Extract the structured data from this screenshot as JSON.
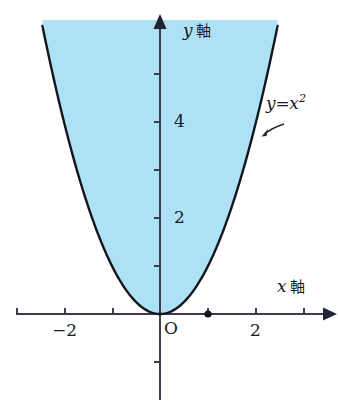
{
  "figure": {
    "kind": "cartesian-plot",
    "background_color": "#ffffff",
    "curve_color": "#15161c",
    "axis_color": "#3a3f4d",
    "fill_color": "#ade1f5",
    "labels": {
      "y_axis_var": "y",
      "y_axis_word": "軸",
      "x_axis_var": "x",
      "x_axis_word": "軸",
      "origin": "O",
      "curve_lhs": "y",
      "curve_eq": "=",
      "curve_rhs_base": "x",
      "curve_rhs_exp": "2"
    },
    "tick_labels": {
      "y_4": "4",
      "y_2": "2",
      "x_neg2": "−2",
      "x_2": "2"
    }
  },
  "chart_data": {
    "type": "line",
    "title": "",
    "subtitle": "",
    "xlabel": "x 軸",
    "ylabel": "y 軸",
    "grid": false,
    "legend": "none",
    "annotations": [
      {
        "text": "y=x²",
        "x": 2.35,
        "y": 5.1,
        "arrow_to_x": 2.28,
        "arrow_to_y": 4.2
      },
      {
        "text": "O",
        "x": 0.1,
        "y": -0.35
      }
    ],
    "xlim": [
      -3.0,
      3.55
    ],
    "ylim": [
      -1.9,
      6.1
    ],
    "xticks": [
      -3,
      -2,
      -1,
      1,
      2,
      3
    ],
    "xticklabels": [
      "",
      "−2",
      "",
      "",
      "2",
      ""
    ],
    "yticks": [
      1,
      2,
      3,
      4,
      5
    ],
    "yticklabels": [
      "",
      "2",
      "",
      "4",
      ""
    ],
    "series": [
      {
        "name": "y=x^2",
        "equation": "y = x^2",
        "color": "#15161c",
        "linewidth": 2.4,
        "fill_above": true,
        "fill_color": "#ade1f5",
        "x": [
          -2.45,
          -2.3,
          -2.1,
          -1.9,
          -1.7,
          -1.5,
          -1.3,
          -1.1,
          -0.9,
          -0.7,
          -0.5,
          -0.3,
          -0.1,
          0.0,
          0.1,
          0.3,
          0.5,
          0.7,
          0.9,
          1.1,
          1.3,
          1.5,
          1.7,
          1.9,
          2.1,
          2.3,
          2.45
        ],
        "y": [
          6.0,
          5.29,
          4.41,
          3.61,
          2.89,
          2.25,
          1.69,
          1.21,
          0.81,
          0.49,
          0.25,
          0.09,
          0.01,
          0.0,
          0.01,
          0.09,
          0.25,
          0.49,
          0.81,
          1.21,
          1.69,
          2.25,
          2.89,
          3.61,
          4.41,
          5.29,
          6.0
        ]
      }
    ],
    "points": [
      {
        "name": "marked-point",
        "x": 1.0,
        "y": 0.0,
        "style": "filled-dot",
        "color": "#15161c"
      }
    ]
  }
}
